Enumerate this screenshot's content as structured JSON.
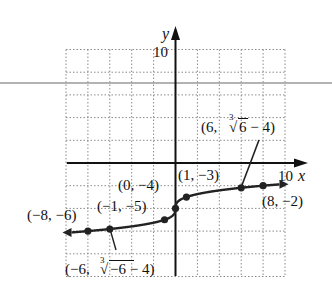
{
  "chart_data": {
    "type": "line",
    "title": "",
    "function": "y = cbrt(x) - 4",
    "xlabel": "x",
    "ylabel": "y",
    "xlim": [
      -10,
      10
    ],
    "ylim": [
      -10,
      10
    ],
    "grid": true,
    "grid_step": 2,
    "tick_labels": {
      "x_max": "10",
      "y_max": "10"
    },
    "points": [
      {
        "x": -8,
        "y": -6,
        "label": "(−8, −6)"
      },
      {
        "x": -6,
        "y": -5.817,
        "label": "(−6, ∛−6 − 4)"
      },
      {
        "x": -1,
        "y": -5,
        "label": "(−1, −5)"
      },
      {
        "x": 0,
        "y": -4,
        "label": "(0, −4)"
      },
      {
        "x": 1,
        "y": -3,
        "label": "(1, −3)"
      },
      {
        "x": 6,
        "y": -2.183,
        "label": "(6, ∛6 − 4)"
      },
      {
        "x": 8,
        "y": -2,
        "label": "(8, −2)"
      }
    ],
    "curve_domain": [
      -9.5,
      9.5
    ],
    "arrows_at_ends": true
  },
  "labels": {
    "y_axis": "y",
    "x_axis": "x",
    "y_tick": "10",
    "x_tick": "10",
    "p_neg8": "(−8, −6)",
    "p_neg1": "(−1, −5)",
    "p_0": "(0, −4)",
    "p_1": "(1, −3)",
    "p_8": "(8, −2)",
    "p_6_a": "(6, ",
    "p_6_b": "6 − 4)",
    "p_neg6_a": "(−6, ",
    "p_neg6_b": "−6 − 4)",
    "root_index": "3",
    "radical": "√"
  },
  "colors": {
    "axis": "#111111",
    "grid": "#8a8a8a",
    "curve": "#222222",
    "rule": "#9a9a9a"
  }
}
